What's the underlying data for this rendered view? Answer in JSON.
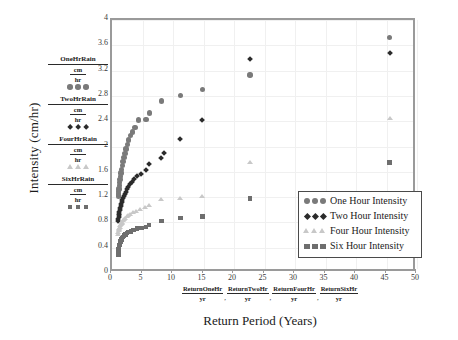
{
  "chart_data": {
    "type": "scatter",
    "title": "",
    "xlabel": "Return Period (Years)",
    "ylabel": "Intensity (cm/hr)",
    "xlim": [
      0,
      50
    ],
    "ylim": [
      0,
      4
    ],
    "xticks": [
      0,
      5,
      10,
      15,
      20,
      25,
      30,
      35,
      40,
      45,
      50
    ],
    "yticks": [
      0,
      0.4,
      0.8,
      1.2,
      1.6,
      2,
      2.4,
      2.8,
      3.2,
      3.6,
      4
    ],
    "grid": true,
    "legend_position": "inside-bottom-right",
    "series": [
      {
        "name": "One Hour Intensity",
        "marker": "circle",
        "color": "#7a7a7a",
        "points": [
          [
            1.02,
            1.22
          ],
          [
            1.06,
            1.25
          ],
          [
            1.1,
            1.29
          ],
          [
            1.15,
            1.33
          ],
          [
            1.2,
            1.38
          ],
          [
            1.26,
            1.43
          ],
          [
            1.32,
            1.48
          ],
          [
            1.4,
            1.53
          ],
          [
            1.48,
            1.58
          ],
          [
            1.58,
            1.64
          ],
          [
            1.68,
            1.7
          ],
          [
            1.8,
            1.76
          ],
          [
            1.95,
            1.83
          ],
          [
            2.1,
            1.89
          ],
          [
            2.3,
            1.96
          ],
          [
            2.5,
            2.03
          ],
          [
            2.75,
            2.1
          ],
          [
            3.05,
            2.17
          ],
          [
            3.4,
            2.23
          ],
          [
            3.8,
            2.3
          ],
          [
            4.3,
            2.42
          ],
          [
            5.6,
            2.43
          ],
          [
            6.1,
            2.53
          ],
          [
            8.1,
            2.72
          ],
          [
            11.2,
            2.81
          ],
          [
            14.8,
            2.9
          ],
          [
            22.6,
            3.13
          ],
          [
            45.5,
            3.72
          ]
        ]
      },
      {
        "name": "Two Hour Intensity",
        "marker": "diamond",
        "color": "#2b2b2b",
        "points": [
          [
            1.02,
            0.82
          ],
          [
            1.05,
            0.85
          ],
          [
            1.09,
            0.88
          ],
          [
            1.13,
            0.91
          ],
          [
            1.18,
            0.94
          ],
          [
            1.23,
            0.97
          ],
          [
            1.29,
            1.0
          ],
          [
            1.35,
            1.03
          ],
          [
            1.42,
            1.06
          ],
          [
            1.5,
            1.09
          ],
          [
            1.59,
            1.12
          ],
          [
            1.69,
            1.15
          ],
          [
            1.8,
            1.18
          ],
          [
            1.93,
            1.21
          ],
          [
            2.08,
            1.25
          ],
          [
            2.25,
            1.28
          ],
          [
            2.45,
            1.32
          ],
          [
            2.68,
            1.36
          ],
          [
            2.95,
            1.4
          ],
          [
            3.28,
            1.44
          ],
          [
            3.68,
            1.48
          ],
          [
            4.15,
            1.53
          ],
          [
            4.8,
            1.57
          ],
          [
            5.6,
            1.63
          ],
          [
            6.1,
            1.73
          ],
          [
            8.1,
            1.82
          ],
          [
            8.6,
            1.89
          ],
          [
            11.2,
            2.12
          ],
          [
            14.8,
            2.42
          ],
          [
            22.6,
            3.38
          ],
          [
            45.5,
            3.48
          ]
        ]
      },
      {
        "name": "Four Hour Intensity",
        "marker": "triangle",
        "color": "#c8c8c8",
        "points": [
          [
            1.02,
            0.6
          ],
          [
            1.06,
            0.63
          ],
          [
            1.11,
            0.66
          ],
          [
            1.16,
            0.68
          ],
          [
            1.22,
            0.7
          ],
          [
            1.29,
            0.72
          ],
          [
            1.37,
            0.74
          ],
          [
            1.46,
            0.76
          ],
          [
            1.56,
            0.78
          ],
          [
            1.68,
            0.8
          ],
          [
            1.82,
            0.82
          ],
          [
            1.98,
            0.84
          ],
          [
            2.17,
            0.86
          ],
          [
            2.4,
            0.88
          ],
          [
            2.67,
            0.9
          ],
          [
            3.0,
            0.92
          ],
          [
            3.4,
            0.95
          ],
          [
            3.9,
            0.97
          ],
          [
            4.55,
            1.0
          ],
          [
            5.4,
            1.03
          ],
          [
            6.1,
            1.06
          ],
          [
            8.1,
            1.15
          ],
          [
            11.2,
            1.18
          ],
          [
            14.8,
            1.21
          ],
          [
            22.6,
            1.74
          ],
          [
            45.5,
            2.43
          ]
        ]
      },
      {
        "name": "Six Hour Intensity",
        "marker": "square",
        "color": "#6e6e6e",
        "points": [
          [
            1.02,
            0.29
          ],
          [
            1.06,
            0.33
          ],
          [
            1.11,
            0.37
          ],
          [
            1.17,
            0.41
          ],
          [
            1.24,
            0.44
          ],
          [
            1.32,
            0.47
          ],
          [
            1.41,
            0.5
          ],
          [
            1.52,
            0.53
          ],
          [
            1.65,
            0.55
          ],
          [
            1.8,
            0.57
          ],
          [
            1.98,
            0.59
          ],
          [
            2.2,
            0.61
          ],
          [
            2.45,
            0.63
          ],
          [
            2.75,
            0.65
          ],
          [
            3.1,
            0.66
          ],
          [
            3.55,
            0.68
          ],
          [
            4.1,
            0.7
          ],
          [
            4.8,
            0.71
          ],
          [
            5.6,
            0.73
          ],
          [
            6.1,
            0.76
          ],
          [
            8.1,
            0.82
          ],
          [
            11.2,
            0.87
          ],
          [
            14.8,
            0.89
          ],
          [
            22.6,
            1.18
          ],
          [
            45.5,
            1.75
          ]
        ]
      }
    ]
  },
  "axes": {
    "y_title": "Intensity (cm/hr)",
    "x_title": "Return Period (Years)",
    "y_tick_labels": [
      "0",
      "0.4",
      "0.8",
      "1.2",
      "1.6",
      "2",
      "2.4",
      "2.8",
      "3.2",
      "3.6",
      "4"
    ],
    "x_tick_labels": [
      "0",
      "5",
      "10",
      "15",
      "20",
      "25",
      "30",
      "35",
      "40",
      "45",
      "50"
    ]
  },
  "legend": {
    "items": [
      {
        "label": "One Hour Intensity",
        "marker": "circle-icon",
        "color": "#7a7a7a"
      },
      {
        "label": "Two Hour Intensity",
        "marker": "diamond-icon",
        "color": "#2b2b2b"
      },
      {
        "label": "Four Hour Intensity",
        "marker": "triangle-icon",
        "color": "#c8c8c8"
      },
      {
        "label": "Six Hour Intensity",
        "marker": "square-icon",
        "color": "#6e6e6e"
      }
    ]
  },
  "y_variable_key": {
    "groups": [
      {
        "name": "OneHrRain",
        "numerator": "cm",
        "denominator": "hr",
        "marker": "circle-icon",
        "color": "#7a7a7a"
      },
      {
        "name": "TwoHrRain",
        "numerator": "cm",
        "denominator": "hr",
        "marker": "diamond-icon",
        "color": "#2b2b2b"
      },
      {
        "name": "FourHrRain",
        "numerator": "cm",
        "denominator": "hr",
        "marker": "triangle-icon",
        "color": "#c8c8c8"
      },
      {
        "name": "SixHrRain",
        "numerator": "cm",
        "denominator": "hr",
        "marker": "square-icon",
        "color": "#6e6e6e"
      }
    ]
  },
  "x_variable_key": {
    "groups": [
      {
        "numerator": "ReturnOneHr",
        "denominator": "yr"
      },
      {
        "numerator": "ReturnTwoHr",
        "denominator": "yr"
      },
      {
        "numerator": "ReturnFourHr",
        "denominator": "yr"
      },
      {
        "numerator": "ReturnSixHr",
        "denominator": "yr"
      }
    ],
    "separator": ","
  },
  "colors": {
    "one_hour": "#7a7a7a",
    "two_hour": "#2b2b2b",
    "four_hour": "#c8c8c8",
    "six_hour": "#6e6e6e",
    "frame": "#9a9a9a",
    "grid": "#f0f0f0"
  }
}
